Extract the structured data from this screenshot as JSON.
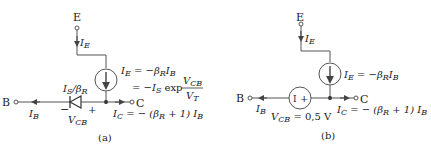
{
  "panel_a": {
    "caption": "(a)",
    "node_E": "E",
    "node_B": "B",
    "node_C": "C",
    "I_E": "I",
    "I_E_sub": "E",
    "I_B": "I",
    "I_B_sub": "B",
    "diode_label": "I",
    "diode_label_sub": "S",
    "diode_label_rest": "/β",
    "diode_label_rest_sub": "R",
    "vcb": "V",
    "vcb_sub": "CB",
    "minus": "−",
    "plus": "+",
    "eq1": "I",
    "eq1_sub": "E",
    "eq1_rest": " = −β",
    "eq1_rest_sub": "R",
    "eq1_tail": "I",
    "eq1_tail_sub": "B",
    "eq2": "= −I",
    "eq2_sub": "S",
    "eq2_rest": " exp",
    "frac_num": "V",
    "frac_num_sub": "CB",
    "frac_den": "V",
    "frac_den_sub": "T",
    "ic": "I",
    "ic_sub": "C",
    "ic_rest": " = − (β",
    "ic_rest_sub": "R",
    "ic_tail": " + 1) I",
    "ic_tail_sub": "B"
  },
  "panel_b": {
    "caption": "(b)",
    "node_E": "E",
    "node_B": "B",
    "node_C": "C",
    "I_E": "I",
    "I_E_sub": "E",
    "I_B": "I",
    "I_B_sub": "B",
    "src_minus": "I",
    "src_plus": "+",
    "vcb": "V",
    "vcb_sub": "CB",
    "vcb_rest": " = 0,5 V",
    "eq1": "I",
    "eq1_sub": "E",
    "eq1_rest": " = −β",
    "eq1_rest_sub": "R",
    "eq1_tail": "I",
    "eq1_tail_sub": "B",
    "ic": "I",
    "ic_sub": "C",
    "ic_rest": " = − (β",
    "ic_rest_sub": "R",
    "ic_tail": " + 1) I",
    "ic_tail_sub": "B"
  }
}
